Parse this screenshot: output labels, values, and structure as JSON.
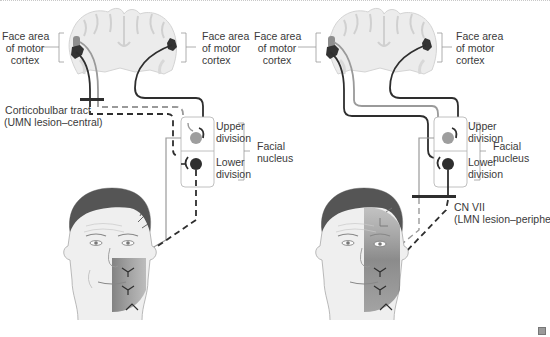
{
  "figure": {
    "left_panel": {
      "label_face_area_left": "Face area\nof motor\ncortex",
      "label_face_area_right": "Face area\nof motor\ncortex",
      "lesion_label": "Corticobulbar tract\n(UMN lesion–central)",
      "upper_division": "Upper\ndivision",
      "lower_division": "Lower\ndivision",
      "facial_nucleus": "Facial\nnucleus"
    },
    "right_panel": {
      "label_face_area_left": "Face area\nof motor\ncortex",
      "label_face_area_right": "Face area\nof motor\ncortex",
      "lesion_label": "CN VII\n(LMN lesion–peripheral)",
      "upper_division": "Upper\ndivision",
      "lower_division": "Lower\ndivision",
      "facial_nucleus": "Facial\nnucleus"
    },
    "colors": {
      "dark_pathway": "#2e2e2e",
      "light_pathway": "#9a9a9a",
      "brain_fill": "#ececec",
      "skin": "#efefef",
      "hair": "#555555",
      "paralysis_shade": "#7a7a7a"
    },
    "corner_icon": "zoom-icon"
  }
}
